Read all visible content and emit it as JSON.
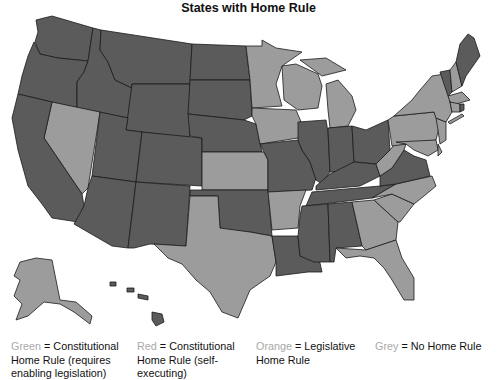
{
  "title": "States with Home Rule",
  "map": {
    "type": "choropleth",
    "region": "United States",
    "rendering": "grayscale",
    "tones": {
      "dark": "#5b5b5b",
      "light": "#9c9c9c"
    }
  },
  "legend": [
    {
      "key": "Green",
      "eq": " = ",
      "text": "Constitutional Home Rule (requires enabling legislation)"
    },
    {
      "key": "Red",
      "eq": " = ",
      "text": "Constitutional Home Rule (self-executing)"
    },
    {
      "key": "Orange",
      "eq": " = ",
      "text": "Legislative Home Rule"
    },
    {
      "key": "Grey",
      "eq": " = ",
      "text": "No Home Rule"
    }
  ]
}
